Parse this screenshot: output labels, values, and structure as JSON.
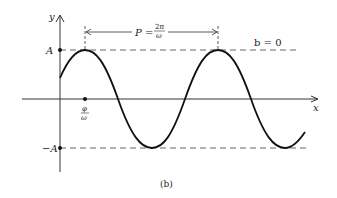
{
  "figure": {
    "caption": "(b)",
    "axes": {
      "x_label": "x",
      "y_label": "y"
    },
    "levels": {
      "top_label": "A",
      "bottom_label": "−A"
    },
    "phase_marker": {
      "numerator": "φ",
      "denominator": "ω"
    },
    "period": {
      "label": "P =",
      "numerator": "2π",
      "denominator": "ω"
    },
    "offset_label": "b = 0",
    "colors": {
      "curve": "#111111",
      "axis": "#333333",
      "dashed": "#555555",
      "background": "#ffffff"
    }
  }
}
